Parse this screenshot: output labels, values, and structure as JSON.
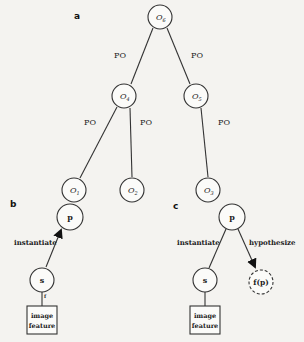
{
  "figure": {
    "panel_a": {
      "label": "a",
      "nodes": {
        "root": {
          "sym": "O",
          "sub": "6"
        },
        "left": {
          "sym": "O",
          "sub": "4"
        },
        "right": {
          "sym": "O",
          "sub": "5"
        },
        "ll": {
          "sym": "O",
          "sub": "1"
        },
        "lr": {
          "sym": "O",
          "sub": "2"
        },
        "rr": {
          "sym": "O",
          "sub": "3"
        }
      },
      "edge_labels": [
        "PO",
        "PO",
        "PO",
        "PO",
        "PO"
      ]
    },
    "panel_b": {
      "label": "b",
      "top_node": "p",
      "bottom_node": "s",
      "edge_label": "instantiate",
      "small_mark": "f",
      "box_line1": "image",
      "box_line2": "feature"
    },
    "panel_c": {
      "label": "c",
      "top_node": "p",
      "bottom_node": "s",
      "hypothesis_node": "f(p)",
      "edge_left_label": "instantiate",
      "edge_right_label": "hypothesize",
      "box_line1": "image",
      "box_line2": "feature"
    }
  }
}
